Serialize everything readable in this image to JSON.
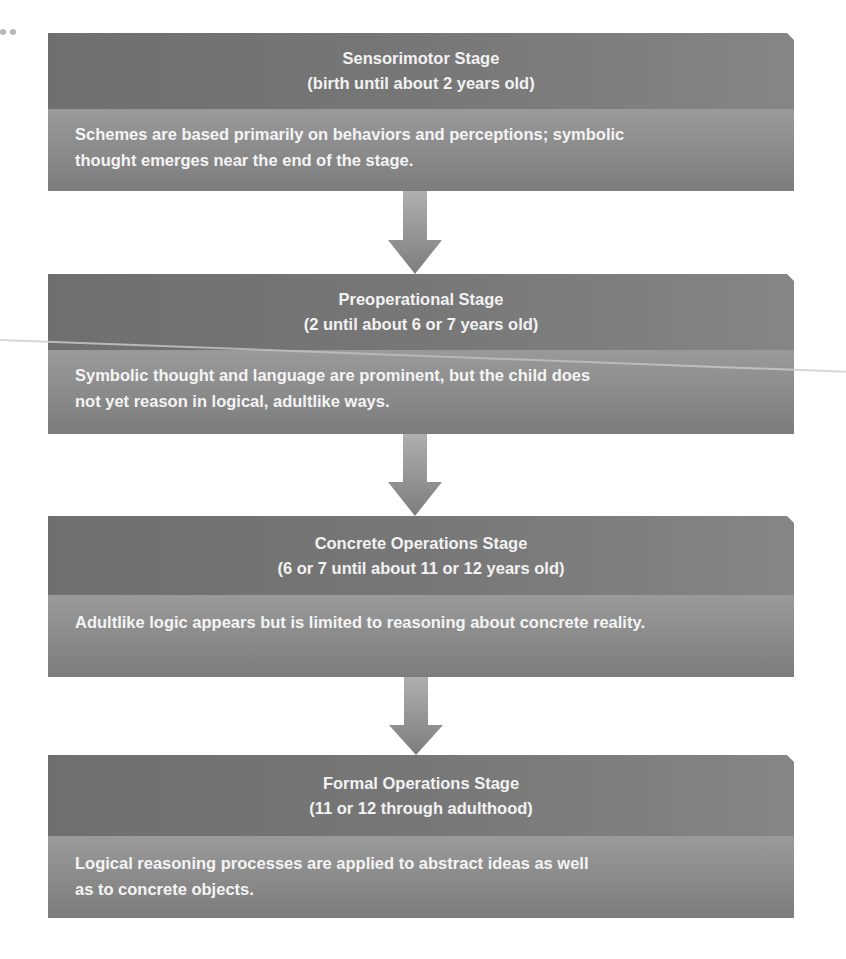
{
  "diagram": {
    "type": "vertical-flowchart",
    "colors": {
      "header_bg": "#777777",
      "body_bg": "#8e8e8e",
      "text": "#f2f2f2",
      "arrow": "#8a8a8a"
    },
    "stages": [
      {
        "title": "Sensorimotor Stage",
        "age_range": "(birth until about 2 years old)",
        "description_lines": [
          "Schemes are based primarily on behaviors and perceptions;  symbolic",
          "thought emerges near the end of the stage."
        ]
      },
      {
        "title": "Preoperational Stage",
        "age_range": "(2 until about 6 or 7 years old)",
        "description_lines": [
          "Symbolic thought and language are prominent, but the child does",
          "not yet reason in logical, adultlike ways."
        ]
      },
      {
        "title": "Concrete Operations Stage",
        "age_range": "(6 or 7 until about 11 or 12 years old)",
        "description_lines": [
          "Adultlike logic appears but is limited to reasoning about concrete reality."
        ]
      },
      {
        "title": "Formal Operations Stage",
        "age_range": "(11 or 12 through adulthood)",
        "description_lines": [
          "Logical reasoning processes are applied to abstract ideas as well",
          "as to concrete objects."
        ]
      }
    ],
    "connectors": [
      {
        "from": 0,
        "to": 1,
        "icon": "down-arrow-icon"
      },
      {
        "from": 1,
        "to": 2,
        "icon": "down-arrow-icon"
      },
      {
        "from": 2,
        "to": 3,
        "icon": "down-arrow-icon"
      }
    ]
  }
}
